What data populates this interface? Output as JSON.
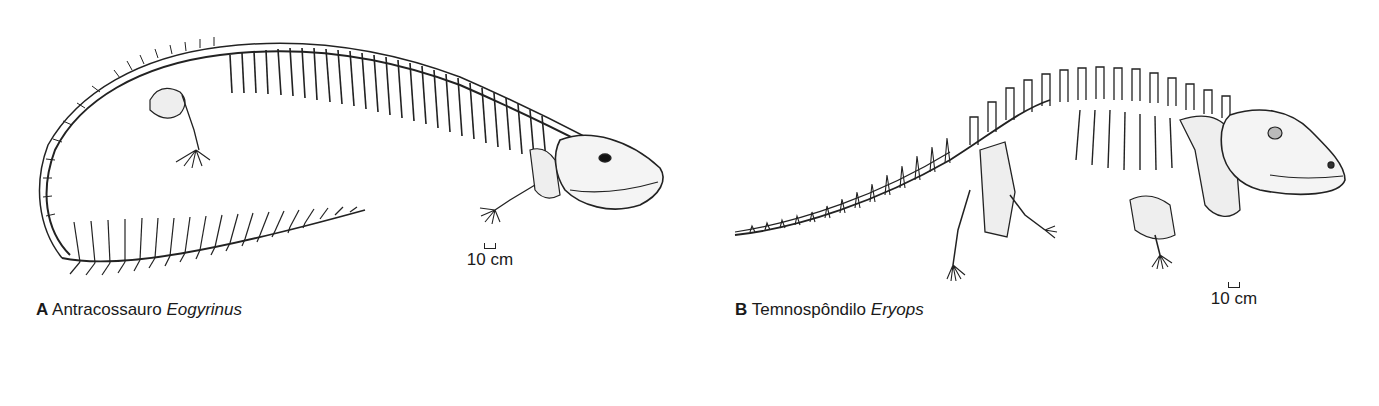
{
  "figure": {
    "panels": [
      {
        "letter": "A",
        "group": "Antracossauro",
        "genus": "Eogyrinus",
        "scale_label": "10 cm"
      },
      {
        "letter": "B",
        "group": "Temnospôndilo",
        "genus": "Eryops",
        "scale_label": "10 cm"
      }
    ]
  }
}
